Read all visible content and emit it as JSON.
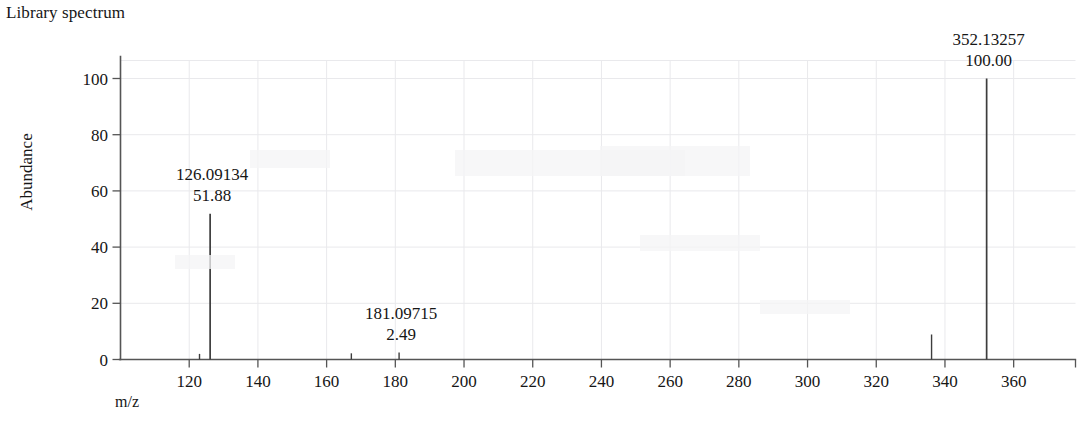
{
  "chart_data": {
    "type": "bar",
    "title": "Library spectrum",
    "xlabel": "m/z",
    "ylabel": "Abundance",
    "xlim": [
      100,
      378
    ],
    "ylim": [
      0,
      108
    ],
    "grid": true,
    "legend_position": "none",
    "x_ticks": [
      120,
      140,
      160,
      180,
      200,
      220,
      240,
      260,
      280,
      300,
      320,
      340,
      360
    ],
    "x_tick_labels": [
      "120",
      "140",
      "160",
      "180",
      "200",
      "220",
      "240",
      "260",
      "280",
      "300",
      "320",
      "340",
      "360"
    ],
    "y_ticks": [
      0,
      20,
      40,
      60,
      80,
      100
    ],
    "y_tick_labels": [
      "0",
      "20",
      "40",
      "60",
      "80",
      "100"
    ],
    "series": [
      {
        "name": "Library spectrum",
        "x": [
          123.0,
          126.09134,
          167.2,
          181.09715,
          336.1,
          352.13257
        ],
        "values": [
          2.0,
          51.88,
          2.2,
          2.49,
          8.9,
          100.0
        ]
      }
    ],
    "annotations": [
      {
        "mz": "126.09134",
        "intensity": "51.88",
        "x": 126.09134,
        "y": 51.88
      },
      {
        "mz": "181.09715",
        "intensity": "2.49",
        "x": 181.09715,
        "y": 2.49
      },
      {
        "mz": "352.13257",
        "intensity": "100.00",
        "x": 352.13257,
        "y": 100.0
      }
    ],
    "colors": {
      "peak": "#3d3d3d",
      "axis": "#555555",
      "grid": "#e9e9ec",
      "text": "#161616",
      "background": "#ffffff"
    }
  }
}
